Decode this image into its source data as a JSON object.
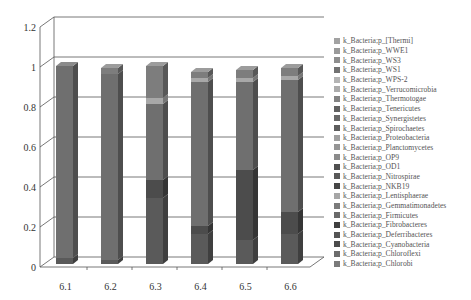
{
  "chart_data": {
    "type": "bar",
    "stacked": true,
    "three_d": true,
    "title": "",
    "xlabel": "",
    "ylabel": "",
    "ylim": [
      0,
      1.2
    ],
    "yticks": [
      "0",
      "0.2",
      "0.4",
      "0.6",
      "0.8",
      "1",
      "1.2"
    ],
    "grid": true,
    "legend_position": "right",
    "categories": [
      "6.1",
      "6.2",
      "6.3",
      "6.4",
      "6.5",
      "6.6"
    ],
    "series": [
      {
        "name": "k_Bacteria;p_Chlorobi",
        "color": "#6e6e6e",
        "values": [
          0.0,
          0.0,
          0.0,
          0.0,
          0.0,
          0.0
        ]
      },
      {
        "name": "k_Bacteria;p_Chloroflexi",
        "color": "#5a5a5a",
        "values": [
          0.03,
          0.02,
          0.33,
          0.15,
          0.12,
          0.15
        ]
      },
      {
        "name": "k_Bacteria;p_Cyanobacteria",
        "color": "#4a4a4a",
        "values": [
          0.0,
          0.0,
          0.0,
          0.0,
          0.0,
          0.0
        ]
      },
      {
        "name": "k_Bacteria;p_Deferribacteres",
        "color": "#525252",
        "values": [
          0.0,
          0.0,
          0.0,
          0.0,
          0.0,
          0.0
        ]
      },
      {
        "name": "k_Bacteria;p_Fibrobacteres",
        "color": "#3e3e3e",
        "values": [
          0.0,
          0.0,
          0.0,
          0.0,
          0.0,
          0.0
        ]
      },
      {
        "name": "k_Bacteria;p_Firmicutes",
        "color": "#4c4c4c",
        "values": [
          0.0,
          0.0,
          0.09,
          0.04,
          0.35,
          0.11
        ]
      },
      {
        "name": "k_Bacteria;p_Gemmatimonadetes",
        "color": "#7a7a7a",
        "values": [
          0.0,
          0.0,
          0.0,
          0.0,
          0.0,
          0.0
        ]
      },
      {
        "name": "k_Bacteria;p_Lentisphaerae",
        "color": "#9e9e9e",
        "values": [
          0.0,
          0.0,
          0.0,
          0.0,
          0.0,
          0.0
        ]
      },
      {
        "name": "k_Bacteria;p_NKB19",
        "color": "#444444",
        "values": [
          0.0,
          0.0,
          0.0,
          0.0,
          0.0,
          0.0
        ]
      },
      {
        "name": "k_Bacteria;p_Nitrospirae",
        "color": "#575757",
        "values": [
          0.0,
          0.0,
          0.0,
          0.0,
          0.0,
          0.0
        ]
      },
      {
        "name": "k_Bacteria;p_OD1",
        "color": "#4e4e4e",
        "values": [
          0.0,
          0.0,
          0.0,
          0.0,
          0.0,
          0.0
        ]
      },
      {
        "name": "k_Bacteria;p_OP9",
        "color": "#8a8a8a",
        "values": [
          0.0,
          0.0,
          0.0,
          0.0,
          0.0,
          0.0
        ]
      },
      {
        "name": "k_Bacteria;p_Planctomycetes",
        "color": "#939393",
        "values": [
          0.0,
          0.0,
          0.0,
          0.0,
          0.0,
          0.0
        ]
      },
      {
        "name": "k_Bacteria;p_Proteobacteria",
        "color": "#6f6f6f",
        "values": [
          0.96,
          0.93,
          0.38,
          0.72,
          0.44,
          0.66
        ]
      },
      {
        "name": "k_Bacteria;p_Spirochaetes",
        "color": "#5c5c5c",
        "values": [
          0.0,
          0.0,
          0.0,
          0.0,
          0.0,
          0.0
        ]
      },
      {
        "name": "k_Bacteria;p_Synergistetes",
        "color": "#666666",
        "values": [
          0.0,
          0.0,
          0.0,
          0.0,
          0.0,
          0.0
        ]
      },
      {
        "name": "k_Bacteria;p_Tenericutes",
        "color": "#606060",
        "values": [
          0.0,
          0.0,
          0.0,
          0.0,
          0.0,
          0.0
        ]
      },
      {
        "name": "k_Bacteria;p_Thermotogae",
        "color": "#818181",
        "values": [
          0.0,
          0.0,
          0.0,
          0.0,
          0.0,
          0.0
        ]
      },
      {
        "name": "k_Bacteria;p_Verrucomicrobia",
        "color": "#a8a8a8",
        "values": [
          0.0,
          0.0,
          0.03,
          0.02,
          0.02,
          0.02
        ]
      },
      {
        "name": "k_Bacteria;p_WPS-2",
        "color": "#b4b4b4",
        "values": [
          0.0,
          0.0,
          0.0,
          0.0,
          0.0,
          0.0
        ]
      },
      {
        "name": "k_Bacteria;p_WS1",
        "color": "#707070",
        "values": [
          0.0,
          0.0,
          0.0,
          0.0,
          0.0,
          0.0
        ]
      },
      {
        "name": "k_Bacteria;p_WS3",
        "color": "#8c8c8c",
        "values": [
          0.0,
          0.0,
          0.0,
          0.0,
          0.0,
          0.0
        ]
      },
      {
        "name": "k_Bacteria;p_WWE1",
        "color": "#999999",
        "values": [
          0.0,
          0.0,
          0.0,
          0.0,
          0.0,
          0.0
        ]
      },
      {
        "name": "k_Bacteria;p_[Thermi]",
        "color": "#7d7d7d",
        "values": [
          0.0,
          0.03,
          0.16,
          0.03,
          0.04,
          0.04
        ]
      }
    ]
  },
  "legend": {
    "items": [
      {
        "label": "k_Bacteria;p_[Thermi]",
        "color": "#a2a2a2"
      },
      {
        "label": "k_Bacteria;p_WWE1",
        "color": "#9a9a9a"
      },
      {
        "label": "k_Bacteria;p_WS3",
        "color": "#8e8e8e"
      },
      {
        "label": "k_Bacteria;p_WS1",
        "color": "#727272"
      },
      {
        "label": "k_Bacteria;p_WPS-2",
        "color": "#b4b4b4"
      },
      {
        "label": "k_Bacteria;p_Verrucomicrobia",
        "color": "#ababab"
      },
      {
        "label": "k_Bacteria;p_Thermotogae",
        "color": "#838383"
      },
      {
        "label": "k_Bacteria;p_Tenericutes",
        "color": "#616161"
      },
      {
        "label": "k_Bacteria;p_Synergistetes",
        "color": "#686868"
      },
      {
        "label": "k_Bacteria;p_Spirochaetes",
        "color": "#5d5d5d"
      },
      {
        "label": "k_Bacteria;p_Proteobacteria",
        "color": "#a0a0a0"
      },
      {
        "label": "k_Bacteria;p_Planctomycetes",
        "color": "#959595"
      },
      {
        "label": "k_Bacteria;p_OP9",
        "color": "#8b8b8b"
      },
      {
        "label": "k_Bacteria;p_OD1",
        "color": "#505050"
      },
      {
        "label": "k_Bacteria;p_Nitrospirae",
        "color": "#595959"
      },
      {
        "label": "k_Bacteria;p_NKB19",
        "color": "#464646"
      },
      {
        "label": "k_Bacteria;p_Lentisphaerae",
        "color": "#a6a6a6"
      },
      {
        "label": "k_Bacteria;p_Gemmatimonadetes",
        "color": "#7b7b7b"
      },
      {
        "label": "k_Bacteria;p_Firmicutes",
        "color": "#6a6a6a"
      },
      {
        "label": "k_Bacteria;p_Fibrobacteres",
        "color": "#3f3f3f"
      },
      {
        "label": "k_Bacteria;p_Deferribacteres",
        "color": "#545454"
      },
      {
        "label": "k_Bacteria;p_Cyanobacteria",
        "color": "#4b4b4b"
      },
      {
        "label": "k_Bacteria;p_Chloroflexi",
        "color": "#6c6c6c"
      },
      {
        "label": "k_Bacteria;p_Chlorobi",
        "color": "#7a7a7a"
      }
    ]
  }
}
